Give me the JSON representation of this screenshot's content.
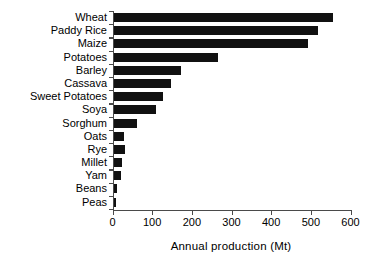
{
  "chart_data": {
    "type": "bar",
    "orientation": "horizontal",
    "title": "",
    "xlabel": "Annual  production (Mt)",
    "ylabel": "",
    "xlim": [
      0,
      600
    ],
    "xticks": [
      0,
      100,
      200,
      300,
      400,
      500,
      600
    ],
    "xtick_labels": [
      "0",
      "100",
      "200",
      "300",
      "400",
      "500",
      "600"
    ],
    "grid": false,
    "legend": null,
    "bar_color": "#111111",
    "axis_color": "#4a4a4a",
    "categories": [
      "Wheat",
      "Paddy Rice",
      "Maize",
      "Potatoes",
      "Barley",
      "Cassava",
      "Sweet Potatoes",
      "Soya",
      "Sorghum",
      "Oats",
      "Rye",
      "Millet",
      "Yam",
      "Beans",
      "Peas"
    ],
    "values": [
      557,
      519,
      494,
      266,
      173,
      148,
      127,
      109,
      62,
      30,
      31,
      24,
      21,
      12,
      9
    ],
    "units": "Mt"
  }
}
